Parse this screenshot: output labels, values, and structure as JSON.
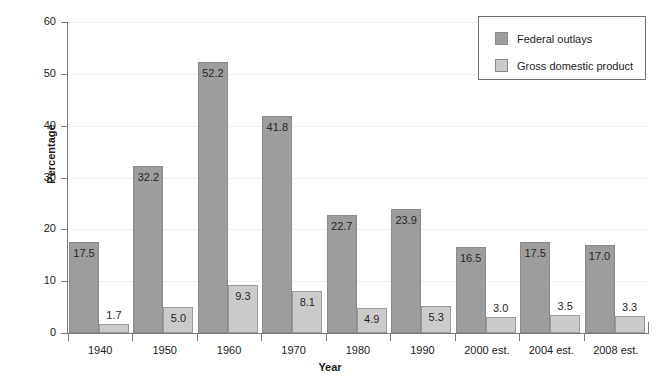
{
  "chart_data": {
    "type": "bar",
    "title": "",
    "xlabel": "Year",
    "ylabel": "Percentage",
    "ylim": [
      0,
      60
    ],
    "yticks": [
      0,
      10,
      20,
      30,
      40,
      50,
      60
    ],
    "ytick_labels": [
      "0",
      "10",
      "20",
      "30",
      "40",
      "50",
      "60"
    ],
    "grid": true,
    "legend_position": "top-right",
    "categories": [
      "1940",
      "1950",
      "1960",
      "1970",
      "1980",
      "1990",
      "2000 est.",
      "2004 est.",
      "2008 est."
    ],
    "series": [
      {
        "name": "Federal outlays",
        "color": "#9d9d9d",
        "values": [
          17.5,
          32.2,
          52.2,
          41.8,
          22.7,
          23.9,
          16.5,
          17.5,
          17.0
        ],
        "labels": [
          "17.5",
          "32.2",
          "52.2",
          "41.8",
          "22.7",
          "23.9",
          "16.5",
          "17.5",
          "17.0"
        ]
      },
      {
        "name": "Gross domestic product",
        "color": "#cbcbcb",
        "values": [
          1.7,
          5.0,
          9.3,
          8.1,
          4.9,
          5.3,
          3.0,
          3.5,
          3.3
        ],
        "labels": [
          "1.7",
          "5.0",
          "9.3",
          "8.1",
          "4.9",
          "5.3",
          "3.0",
          "3.5",
          "3.3"
        ]
      }
    ]
  },
  "legend": {
    "items": [
      {
        "label": "Federal outlays",
        "swatch": "series-0"
      },
      {
        "label": "Gross domestic product",
        "swatch": "series-1"
      }
    ]
  }
}
